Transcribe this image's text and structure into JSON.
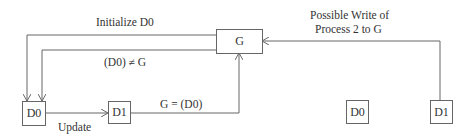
{
  "nodes": {
    "g": "G",
    "d0_left": "D0",
    "d1_left": "D1",
    "d0_right": "D0",
    "d1_right": "D1"
  },
  "edges": {
    "initialize": "Initialize D0",
    "not_equal": "(D0) ≠ G",
    "update": "Update",
    "assign": "G = (D0)",
    "possible_write_line1": "Possible Write of",
    "possible_write_line2": "Process 2 to G"
  },
  "colors": {
    "line": "#666666",
    "text": "#333333"
  }
}
